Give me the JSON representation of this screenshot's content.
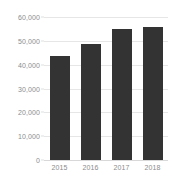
{
  "chart_data": {
    "type": "bar",
    "title": "",
    "subtitle": "",
    "xlabel": "",
    "ylabel": "",
    "categories": [
      "2015",
      "2016",
      "2017",
      "2018"
    ],
    "values": [
      43600,
      48700,
      54800,
      55800
    ],
    "ylim": [
      0,
      60000
    ],
    "ytick_values": [
      0,
      10000,
      20000,
      30000,
      40000,
      50000,
      60000
    ],
    "ytick_labels": [
      "0",
      "10,000",
      "20,000",
      "30,000",
      "40,000",
      "50,000",
      "60,000"
    ],
    "grid": true,
    "grid_axis": "y",
    "legend": false,
    "legend_position": "none",
    "series": [
      {
        "name": "",
        "values": [
          43600,
          48700,
          54800,
          55800
        ]
      }
    ]
  },
  "style": {
    "bar_color": "#333333",
    "gridline_color": "#e6e6e6",
    "baseline_color": "#d8d8d8",
    "tick_label_color": "#8c8c8c",
    "background_color": "#ffffff"
  }
}
